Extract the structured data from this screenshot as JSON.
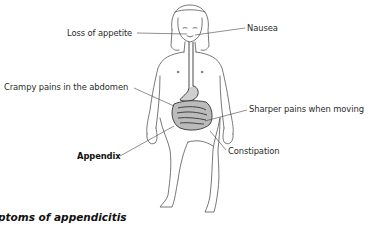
{
  "diagram": {
    "labels": {
      "loss_of_appetite": "Loss of appetite",
      "nausea": "Nausea",
      "crampy_pains": "Crampy pains in the abdomen",
      "sharper_pains": "Sharper pains when moving",
      "appendix": "Appendix",
      "constipation": "Constipation"
    },
    "caption": "ptoms of appendicitis"
  }
}
